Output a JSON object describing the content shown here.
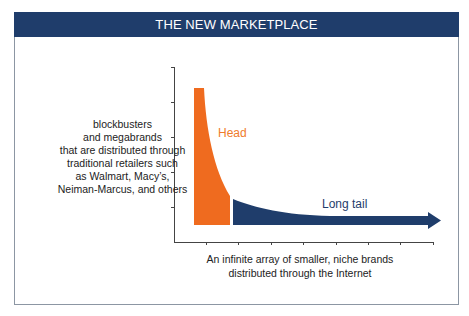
{
  "header": {
    "title": "THE NEW MARKETPLACE"
  },
  "labels": {
    "left": [
      "blockbusters",
      "and megabrands",
      "that are distributed through",
      "traditional retailers such",
      "as Walmart, Macy’s,",
      "Neiman-Marcus, and others"
    ],
    "bottom": [
      "An infinite array of smaller, niche brands",
      "distributed through the Internet"
    ],
    "head": "Head",
    "tail": "Long tail"
  },
  "colors": {
    "header_bg": "#1f3d6b",
    "head": "#ef6b1f",
    "tail": "#1f3d6b",
    "axis": "#444444",
    "frame": "#8c96a3"
  }
}
